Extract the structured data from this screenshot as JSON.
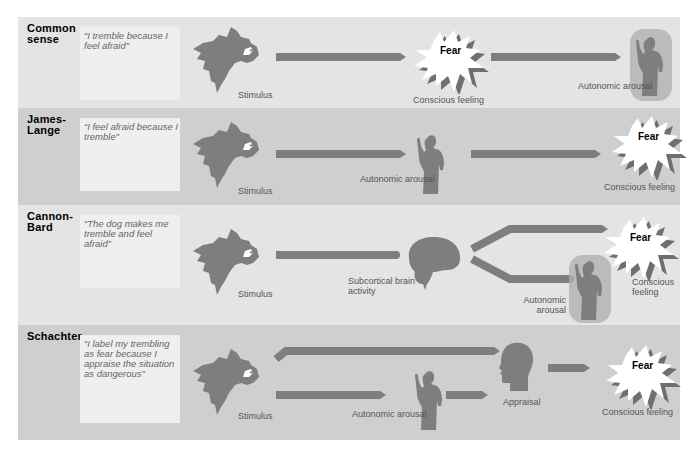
{
  "diagram": {
    "colors": {
      "panel_light": "#e4e4e4",
      "panel_dark": "#cfcfcf",
      "quote_box": "#efefef",
      "figure": "#7e7e7e",
      "halo": "#b0b0b0",
      "fear_burst": "#ffffff"
    },
    "rows": [
      {
        "theory": "Common sense",
        "quote": "“I tremble because I feel afraid”",
        "stimulus_label": "Stimulus",
        "middle_label": "Conscious feeling",
        "middle_icon": "fear-burst-icon",
        "fear_text": "Fear",
        "end_label": "Autonomic arousal",
        "end_icon": "trembling-person-icon"
      },
      {
        "theory": "James-Lange",
        "quote": "“I feel afraid because I tremble”",
        "stimulus_label": "Stimulus",
        "middle_label": "Autonomic arousal",
        "middle_icon": "trembling-person-icon",
        "end_label": "Conscious feeling",
        "end_icon": "fear-burst-icon",
        "fear_text": "Fear"
      },
      {
        "theory": "Cannon-Bard",
        "quote": "“The dog makes me tremble and feel afraid”",
        "stimulus_label": "Stimulus",
        "middle_label": "Subcortical brain activity",
        "middle_icon": "brain-icon",
        "branch_top_label": "Conscious feeling",
        "branch_top_icon": "fear-burst-icon",
        "fear_text": "Fear",
        "branch_bottom_label": "Autonomic arousal",
        "branch_bottom_icon": "trembling-person-icon"
      },
      {
        "theory": "Schachter",
        "quote": "“I label my trembling as fear because I appraise the situation as dangerous”",
        "stimulus_label": "Stimulus",
        "arousal_label": "Autonomic arousal",
        "arousal_icon": "trembling-person-icon",
        "appraisal_label": "Appraisal",
        "appraisal_icon": "head-profile-icon",
        "end_label": "Conscious feeling",
        "end_icon": "fear-burst-icon",
        "fear_text": "Fear"
      }
    ]
  }
}
